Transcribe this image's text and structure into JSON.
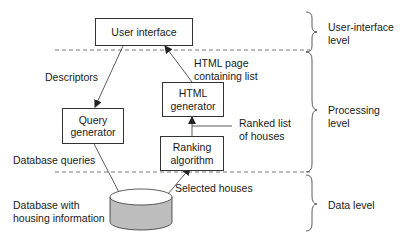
{
  "boxes": {
    "user_interface": "User interface",
    "query_generator": "Query\ngenerator",
    "html_generator": "HTML\ngenerator",
    "ranking_algorithm": "Ranking\nalgorithm"
  },
  "edges": {
    "descriptors": "Descriptors",
    "html_page": "HTML page\ncontaining list",
    "ranked_list": "Ranked list\nof houses",
    "database_queries": "Database queries",
    "selected_houses": "Selected houses"
  },
  "database": {
    "label": "Database with\nhousing information",
    "fill_color": "#bdbdbd"
  },
  "levels": [
    {
      "label": "User-interface\nlevel"
    },
    {
      "label": "Processing\nlevel"
    },
    {
      "label": "Data level"
    }
  ]
}
